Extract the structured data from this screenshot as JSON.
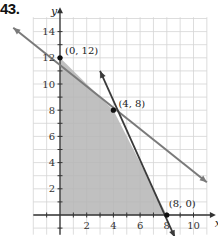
{
  "problem": {
    "number": "43."
  },
  "chart_data": {
    "type": "line",
    "title": "",
    "xlabel": "x",
    "ylabel": "y",
    "xlim": [
      -2,
      11
    ],
    "ylim": [
      -1.5,
      15
    ],
    "grid": true,
    "x_ticks": [
      2,
      4,
      6,
      8,
      10
    ],
    "y_ticks": [
      2,
      4,
      6,
      8,
      10,
      12,
      14
    ],
    "series": [
      {
        "name": "line-1",
        "color": "#7a7a7a",
        "points": [
          [
            -3.5,
            14.3
          ],
          [
            11,
            2.5
          ]
        ],
        "note": "y = 12 - x/2 (light gray line with arrows)"
      },
      {
        "name": "line-2",
        "color": "#3a3a3a",
        "points": [
          [
            3,
            11
          ],
          [
            8.6,
            -1.7
          ]
        ],
        "note": "y = 24 - 2x (dark line with arrows)"
      }
    ],
    "shaded_region": {
      "color": "#b5b5b5",
      "vertices": [
        [
          0,
          0
        ],
        [
          0,
          12
        ],
        [
          4,
          8
        ],
        [
          8,
          0
        ]
      ]
    },
    "labeled_points": [
      {
        "label": "(0, 12)",
        "x": 0,
        "y": 12
      },
      {
        "label": "(4, 8)",
        "x": 4,
        "y": 8
      },
      {
        "label": "(8, 0)",
        "x": 8,
        "y": 0
      }
    ]
  }
}
